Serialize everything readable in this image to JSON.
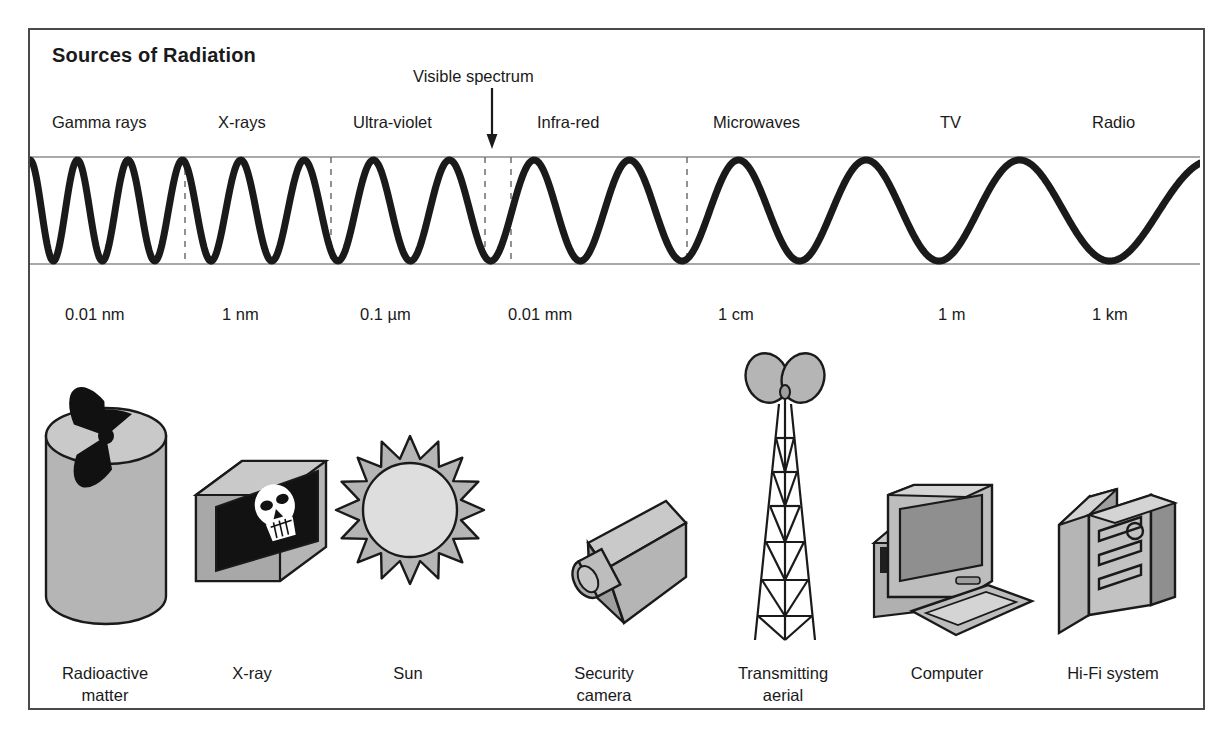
{
  "figure": {
    "title": "Sources of Radiation",
    "annotation": "Visible spectrum",
    "border_color": "#4a4a4a",
    "wave_color": "#1a1a1a",
    "axis_color": "#8c8c8c",
    "fill_grey": "#b5b5b5",
    "fill_light": "#d9d9d9",
    "fill_dark": "#8f8f8f"
  },
  "chart_data": {
    "type": "line",
    "title": "Sources of Radiation",
    "xlabel": "",
    "ylabel": "",
    "grid": false,
    "legend_position": "none",
    "annotations": [
      "Visible spectrum"
    ],
    "categories": [
      "Gamma rays",
      "X-rays",
      "Ultra-violet",
      "Infra-red",
      "Microwaves",
      "TV",
      "Radio"
    ],
    "x_tick_labels": [
      "0.01 nm",
      "1 nm",
      "0.1 µm",
      "0.01 mm",
      "1 cm",
      "1 m",
      "1 km"
    ],
    "series": [
      {
        "name": "wavelength",
        "units": "relative",
        "values": [
          1,
          10,
          100,
          1000,
          10000,
          100000,
          1000000
        ]
      }
    ],
    "band_divider_positions": [
      185,
      331,
      485,
      511,
      687
    ]
  },
  "bands": [
    {
      "label": "Gamma rays",
      "x": 52,
      "source": "Radioactive matter"
    },
    {
      "label": "X-rays",
      "x": 218,
      "source": "X-ray"
    },
    {
      "label": "Ultra-violet",
      "x": 353,
      "source": "Sun"
    },
    {
      "label": "Infra-red",
      "x": 537,
      "source": "Security camera"
    },
    {
      "label": "Microwaves",
      "x": 713,
      "source": "Transmitting aerial"
    },
    {
      "label": "TV",
      "x": 940,
      "source": "Computer"
    },
    {
      "label": "Radio",
      "x": 1092,
      "source": "Hi-Fi system"
    }
  ],
  "scale": [
    {
      "label": "0.01 nm",
      "x": 65
    },
    {
      "label": "1 nm",
      "x": 222
    },
    {
      "label": "0.1 µm",
      "x": 360
    },
    {
      "label": "0.01 mm",
      "x": 508
    },
    {
      "label": "1 cm",
      "x": 718
    },
    {
      "label": "1 m",
      "x": 938
    },
    {
      "label": "1 km",
      "x": 1092
    }
  ],
  "sources": [
    {
      "caption": "Radioactive\nmatter",
      "icon": "radioactive-drum-icon",
      "cx": 105,
      "cy": 676
    },
    {
      "caption": "X-ray",
      "icon": "xray-lightbox-icon",
      "cx": 252,
      "cy": 676
    },
    {
      "caption": "Sun",
      "icon": "sun-icon",
      "cx": 408,
      "cy": 676
    },
    {
      "caption": "Security\ncamera",
      "icon": "security-camera-icon",
      "cx": 604,
      "cy": 676
    },
    {
      "caption": "Transmitting\naerial",
      "icon": "transmitting-aerial-icon",
      "cx": 783,
      "cy": 676
    },
    {
      "caption": "Computer",
      "icon": "computer-icon",
      "cx": 947,
      "cy": 676
    },
    {
      "caption": "Hi-Fi system",
      "icon": "hifi-system-icon",
      "cx": 1113,
      "cy": 676
    }
  ]
}
